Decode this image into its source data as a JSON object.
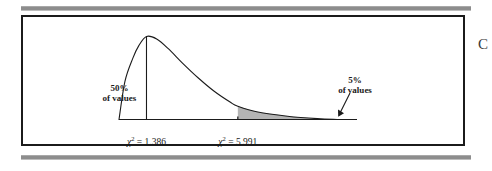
{
  "figure": {
    "margin_character": "C"
  },
  "chart_data": {
    "type": "area",
    "title": "",
    "subtitle": "",
    "xlabel": "",
    "ylabel": "",
    "distribution": "chi-square",
    "degrees_of_freedom": 2,
    "grid": false,
    "legend": "none",
    "xlim": [
      0,
      12
    ],
    "ylim": [
      0,
      1
    ],
    "curve_points": [
      {
        "x": 0.0,
        "y": 0.0
      },
      {
        "x": 0.3,
        "y": 0.46
      },
      {
        "x": 0.7,
        "y": 0.74
      },
      {
        "x": 1.0,
        "y": 0.89
      },
      {
        "x": 1.386,
        "y": 1.0
      },
      {
        "x": 1.9,
        "y": 0.97
      },
      {
        "x": 2.5,
        "y": 0.85
      },
      {
        "x": 3.2,
        "y": 0.68
      },
      {
        "x": 4.0,
        "y": 0.5
      },
      {
        "x": 4.8,
        "y": 0.34
      },
      {
        "x": 5.6,
        "y": 0.21
      },
      {
        "x": 5.991,
        "y": 0.16
      },
      {
        "x": 7.0,
        "y": 0.09
      },
      {
        "x": 8.5,
        "y": 0.04
      },
      {
        "x": 10.0,
        "y": 0.01
      },
      {
        "x": 11.0,
        "y": 0.0
      }
    ],
    "markers": [
      {
        "name": "median",
        "x": 1.386,
        "label": "χ² = 1.386",
        "chi_symbol": "χ",
        "superscript": "2",
        "value_text": "= 1.386",
        "annotation_line_1": "50%",
        "annotation_line_2": "of values",
        "annotation": "50% of values",
        "area_percent": 50,
        "line": "vertical-from-axis-to-curve"
      },
      {
        "name": "critical-value",
        "x": 5.991,
        "label": "χ² = 5.991",
        "chi_symbol": "χ",
        "superscript": "2",
        "value_text": "= 5.991",
        "annotation_line_1": "5%",
        "annotation_line_2": "of values",
        "annotation": "5% of values",
        "area_percent": 5,
        "shaded": true,
        "shade_color": "#b4b4b4",
        "arrow": "points-down-left-to-shaded-tail"
      }
    ],
    "colors": {
      "curve": "#1b1b1b",
      "axis": "#1b1b1b",
      "frame": "#1b1b1b",
      "shaded_tail": "#b4b4b4",
      "rule": "#8d8d8d",
      "background": "#ffffff"
    }
  }
}
